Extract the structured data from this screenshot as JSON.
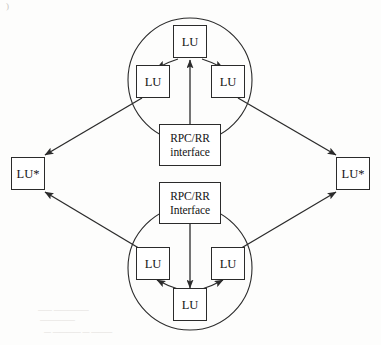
{
  "figure": {
    "type": "network-diagram",
    "background_color": "#fdfdfc",
    "line_color": "#2b2b2b"
  },
  "nodes": {
    "top_cluster": {
      "label": "top-cluster",
      "center_lu": {
        "label": "LU"
      },
      "left_lu": {
        "label": "LU"
      },
      "right_lu": {
        "label": "LU"
      },
      "interface": {
        "line1": "RPC/RR",
        "line2": "interface"
      }
    },
    "bottom_cluster": {
      "label": "bottom-cluster",
      "center_lu": {
        "label": "LU"
      },
      "left_lu": {
        "label": "LU"
      },
      "right_lu": {
        "label": "LU"
      },
      "interface": {
        "line1": "RPC/RR",
        "line2": "Interface"
      }
    },
    "left_external": {
      "label": "LU*"
    },
    "right_external": {
      "label": "LU*"
    }
  },
  "edges": [
    {
      "from": "top-interface",
      "to": "top-center-lu",
      "direction": "up"
    },
    {
      "from": "top-center-lu",
      "to": "top-left-lu",
      "direction": "down-left"
    },
    {
      "from": "top-center-lu",
      "to": "top-right-lu",
      "direction": "down-right"
    },
    {
      "from": "top-left-lu",
      "to": "left-external-lu-star",
      "direction": "down-left"
    },
    {
      "from": "top-right-lu",
      "to": "right-external-lu-star",
      "direction": "down-right"
    },
    {
      "from": "bottom-interface",
      "to": "bottom-center-lu",
      "direction": "down"
    },
    {
      "from": "bottom-center-lu",
      "to": "bottom-left-lu",
      "direction": "up-left"
    },
    {
      "from": "bottom-center-lu",
      "to": "bottom-right-lu",
      "direction": "up-right"
    },
    {
      "from": "bottom-left-lu",
      "to": "left-external-lu-star",
      "direction": "up-left"
    },
    {
      "from": "bottom-right-lu",
      "to": "right-external-lu-star",
      "direction": "up-right"
    }
  ],
  "artifacts": {
    "corner_mark": ")",
    "bleed_line_1": "—— —————",
    "bleed_line_2": "—————",
    "bleed_line_3": "— ———— — ———"
  }
}
